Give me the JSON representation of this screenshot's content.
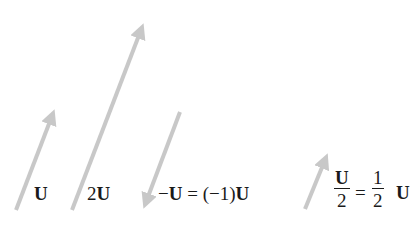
{
  "arrow_color": "#c8c8c8",
  "vectors": [
    {
      "id": "u",
      "label_bold": "U",
      "label_prefix": ""
    },
    {
      "id": "two-u",
      "label_prefix": "2",
      "label_bold": "U"
    },
    {
      "id": "neg-u",
      "label_prefix": "−",
      "label_bold": "U",
      "label_suffix": " = (−1)",
      "label_bold2": "U"
    },
    {
      "id": "half-u",
      "frac1_num": "U",
      "frac1_den": "2",
      "equals": "=",
      "frac2_num": "1",
      "frac2_den": "2",
      "label_bold": "U"
    }
  ]
}
